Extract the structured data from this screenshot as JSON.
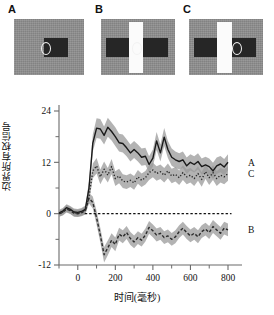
{
  "panels": [
    {
      "letter": "A",
      "config": "single dark horizontal bar with fixation ring, uniform gray surround",
      "has_vertical_bars": false,
      "has_left_bar": false
    },
    {
      "letter": "B",
      "config": "dark horizontal bar crossed by a bright vertical bar, fixation ring at center",
      "has_vertical_bars": true,
      "has_left_bar": true
    },
    {
      "letter": "C",
      "config": "two dark horizontal bars separated by a bright vertical bar, fixation ring on right bar",
      "has_vertical_bars": true,
      "has_left_bar": true
    }
  ],
  "chart_data": {
    "type": "line",
    "title": "",
    "xlabel": "时间(毫秒)",
    "ylabel": "边界所有权信号",
    "xlim": [
      -100,
      800
    ],
    "ylim": [
      -12,
      24
    ],
    "xticks": [
      0,
      200,
      400,
      600,
      800
    ],
    "xtick_labels": [
      "0",
      "200",
      "400",
      "600",
      "800"
    ],
    "xminor_ticks": [
      -100,
      100,
      300,
      500,
      700
    ],
    "yticks": [
      -12,
      0,
      12,
      24
    ],
    "ytick_labels": [
      "-12",
      "0",
      "12",
      "24"
    ],
    "yminor_ticks": [
      -6,
      6,
      18
    ],
    "grid": false,
    "legend_position": "right-inline",
    "zero_line": {
      "value": 0,
      "style": "dotted"
    },
    "error_band": "shaded gray standard error",
    "x": [
      -100,
      -80,
      -60,
      -40,
      -20,
      0,
      20,
      40,
      60,
      80,
      100,
      120,
      140,
      160,
      180,
      200,
      220,
      240,
      260,
      280,
      300,
      320,
      340,
      360,
      380,
      400,
      420,
      440,
      460,
      480,
      500,
      520,
      540,
      560,
      580,
      600,
      620,
      640,
      660,
      680,
      700,
      720,
      740,
      760,
      780,
      800
    ],
    "series": [
      {
        "name": "A",
        "label": "A",
        "style": "solid",
        "color": "#1a1a1a",
        "values": [
          0.2,
          0.6,
          1.4,
          1.0,
          0.4,
          0.3,
          0.5,
          1.0,
          6.0,
          16.5,
          20.0,
          19.8,
          18.3,
          20.2,
          19.2,
          18.0,
          16.6,
          16.4,
          15.4,
          14.2,
          15.0,
          14.2,
          13.2,
          13.4,
          11.5,
          13.0,
          17.0,
          14.2,
          17.9,
          15.0,
          13.2,
          12.6,
          12.2,
          12.6,
          11.2,
          12.0,
          11.5,
          12.2,
          11.0,
          11.4,
          11.0,
          10.0,
          11.2,
          11.6,
          10.9,
          12.0
        ],
        "se": [
          0.7,
          0.7,
          0.8,
          0.8,
          0.8,
          0.8,
          0.8,
          0.9,
          1.5,
          2.0,
          2.3,
          2.3,
          2.1,
          2.2,
          2.1,
          2.2,
          2.1,
          2.1,
          2.0,
          2.0,
          2.0,
          2.0,
          2.0,
          2.0,
          1.9,
          2.0,
          2.1,
          2.0,
          2.1,
          2.0,
          2.0,
          1.9,
          1.9,
          1.9,
          1.9,
          1.9,
          1.9,
          1.9,
          1.9,
          1.9,
          1.9,
          1.9,
          1.9,
          1.9,
          1.9,
          1.9
        ]
      },
      {
        "name": "C",
        "label": "C",
        "style": "dotted",
        "color": "#2b2b2b",
        "values": [
          0.0,
          0.4,
          1.2,
          0.8,
          0.2,
          0.1,
          0.3,
          0.8,
          4.0,
          10.0,
          11.2,
          8.6,
          10.4,
          9.0,
          11.0,
          8.2,
          8.8,
          7.6,
          7.4,
          7.8,
          7.2,
          8.6,
          7.8,
          8.4,
          9.6,
          10.2,
          9.4,
          9.8,
          9.0,
          10.0,
          8.8,
          9.2,
          8.4,
          9.6,
          8.6,
          9.0,
          8.2,
          9.4,
          8.0,
          9.8,
          8.4,
          9.6,
          8.2,
          9.0,
          8.6,
          9.4
        ],
        "se": [
          0.7,
          0.7,
          0.8,
          0.8,
          0.8,
          0.8,
          0.8,
          0.9,
          1.3,
          1.7,
          1.8,
          1.7,
          1.8,
          1.7,
          1.8,
          1.7,
          1.7,
          1.6,
          1.6,
          1.6,
          1.6,
          1.6,
          1.6,
          1.6,
          1.7,
          1.7,
          1.7,
          1.7,
          1.7,
          1.7,
          1.7,
          1.7,
          1.7,
          1.7,
          1.7,
          1.7,
          1.7,
          1.7,
          1.7,
          1.7,
          1.7,
          1.7,
          1.7,
          1.7,
          1.7,
          1.7
        ]
      },
      {
        "name": "B",
        "label": "B",
        "style": "dashed",
        "color": "#2b2b2b",
        "values": [
          0.0,
          0.3,
          1.1,
          0.7,
          0.1,
          0.0,
          0.2,
          0.7,
          3.6,
          2.6,
          -1.0,
          -5.0,
          -9.6,
          -8.0,
          -6.2,
          -7.2,
          -4.8,
          -5.4,
          -4.4,
          -5.8,
          -6.6,
          -5.6,
          -6.2,
          -5.0,
          -3.2,
          -4.0,
          -5.0,
          -4.6,
          -5.6,
          -5.2,
          -6.0,
          -5.4,
          -4.2,
          -3.4,
          -4.4,
          -5.2,
          -4.6,
          -5.4,
          -4.2,
          -3.6,
          -4.4,
          -3.0,
          -3.8,
          -4.6,
          -3.4,
          -3.8
        ],
        "se": [
          0.7,
          0.7,
          0.8,
          0.8,
          0.8,
          0.8,
          0.8,
          0.9,
          1.2,
          1.4,
          1.6,
          1.7,
          1.8,
          1.7,
          1.6,
          1.6,
          1.5,
          1.5,
          1.5,
          1.5,
          1.5,
          1.5,
          1.5,
          1.5,
          1.5,
          1.5,
          1.5,
          1.5,
          1.5,
          1.5,
          1.5,
          1.5,
          1.5,
          1.5,
          1.5,
          1.5,
          1.5,
          1.5,
          1.5,
          1.5,
          1.5,
          1.5,
          1.5,
          1.5,
          1.5,
          1.5
        ]
      }
    ]
  }
}
